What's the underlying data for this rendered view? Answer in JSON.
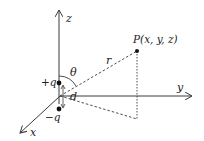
{
  "diagram": {
    "axes": {
      "x_label": "x",
      "y_label": "y",
      "z_label": "z"
    },
    "charges": {
      "positive_label": "+q",
      "negative_label": "−q",
      "separation_label": "d"
    },
    "point": {
      "label": "P(x, y, z)"
    },
    "distance_label": "r",
    "angle_label": "θ",
    "colors": {
      "line": "#3a3a3a",
      "text": "#222222",
      "background": "#ffffff"
    }
  }
}
